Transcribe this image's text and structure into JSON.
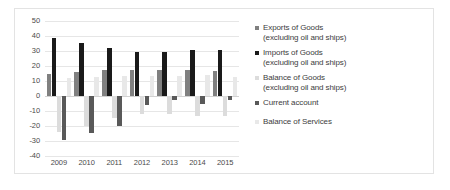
{
  "chart_data": {
    "type": "bar",
    "title": "",
    "xlabel": "",
    "ylabel": "",
    "categories": [
      "2009",
      "2010",
      "2011",
      "2012",
      "2013",
      "2014",
      "2015"
    ],
    "ylim": [
      -40,
      50
    ],
    "ytick_step": 10,
    "yticks": [
      "50",
      "40",
      "30",
      "20",
      "10",
      "0",
      "-10",
      "-20",
      "-30",
      "-40"
    ],
    "grid": true,
    "legend_position": "right",
    "series": [
      {
        "name": "Exports of Goods\n(excluding oil and ships)",
        "color": "#808080",
        "values": [
          14.5,
          16.0,
          17.5,
          17.5,
          17.5,
          17.5,
          17.0
        ]
      },
      {
        "name": "Imports of Goods\n(excluding oil and ships)",
        "color": "#1a1a1a",
        "values": [
          38.5,
          35.5,
          32.0,
          29.5,
          29.5,
          30.5,
          30.5
        ]
      },
      {
        "name": "Balance of Goods\n(excluding oil and ships)",
        "color": "#dcdcdc",
        "values": [
          -24.0,
          -20.0,
          -14.5,
          -12.0,
          -12.0,
          -13.0,
          -13.5
        ]
      },
      {
        "name": "Current account",
        "color": "#595959",
        "values": [
          -29.0,
          -24.5,
          -20.0,
          -6.0,
          -2.5,
          -5.0,
          -2.5
        ]
      },
      {
        "name": "Balance of Services",
        "color": "#e8e8e8",
        "values": [
          12.0,
          12.5,
          13.5,
          13.5,
          13.5,
          14.0,
          13.0
        ]
      }
    ]
  }
}
